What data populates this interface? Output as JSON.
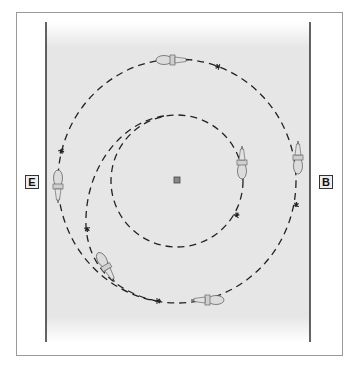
{
  "diagram": {
    "type": "riding-arena-figure",
    "markers": [
      {
        "id": "E",
        "label": "E",
        "side": "left"
      },
      {
        "id": "B",
        "label": "B",
        "side": "right"
      }
    ],
    "center_marker": "X",
    "paths": [
      {
        "name": "large-circle",
        "style": "dashed"
      },
      {
        "name": "small-circle",
        "style": "dashed"
      },
      {
        "name": "spiral-in-line",
        "style": "dashed"
      }
    ],
    "horses": 6,
    "colors": {
      "arena_fill": "#e9e9e9",
      "path": "#222222",
      "rail": "#222222",
      "frame": "#9a9a9a",
      "horse": "#d8d8d8"
    }
  }
}
